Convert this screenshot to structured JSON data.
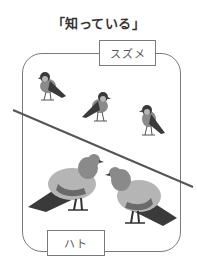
{
  "title": "「知っている」",
  "groups": {
    "upper": {
      "label": "スズメ",
      "count": 3
    },
    "lower": {
      "label": "ハト",
      "count": 2
    }
  },
  "colors": {
    "line": "#555555",
    "frame": "#7a7a7a",
    "bird_dark": "#3a3a3a",
    "bird_mid": "#7d7d7d",
    "bird_light": "#b5b5b5"
  }
}
